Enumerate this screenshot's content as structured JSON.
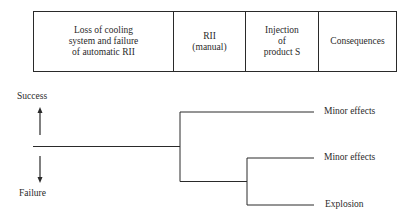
{
  "header": {
    "columns": [
      {
        "label": "Loss of cooling\nsystem and failure\nof automatic RII"
      },
      {
        "label": "RII\n(manual)"
      },
      {
        "label": "Injection\nof\nproduct S"
      },
      {
        "label": "Consequences"
      }
    ]
  },
  "legend": {
    "success_label": "Success",
    "failure_label": "Failure"
  },
  "tree": {
    "outcomes": [
      {
        "label": "Minor effects"
      },
      {
        "label": "Minor effects"
      },
      {
        "label": "Explosion"
      }
    ]
  },
  "colors": {
    "line": "#2a2a2a",
    "background": "#ffffff"
  }
}
